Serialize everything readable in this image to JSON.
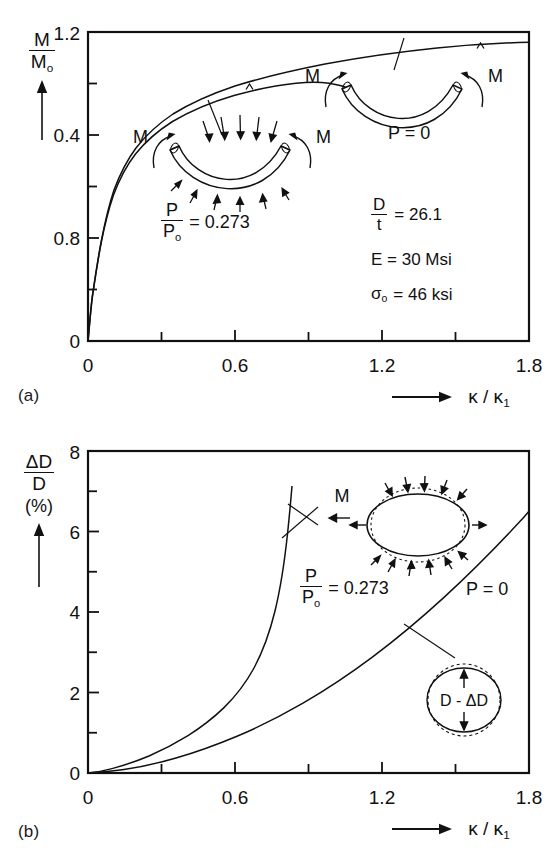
{
  "figure": {
    "kind": "two-panel line chart",
    "panel_tags": [
      "(a)",
      "(b)"
    ]
  },
  "panel_a": {
    "tag": "(a)",
    "ylabel": {
      "num": "M",
      "den": "M",
      "den_sub": "o",
      "arrow": "up-arrow"
    },
    "xlabel": {
      "text": "κ / κ",
      "sub": "1",
      "arrow": "right-arrow"
    },
    "yticks": [
      "0",
      "0.4",
      "0.8",
      "1.2"
    ],
    "xticks": [
      "0",
      "0.6",
      "1.2",
      "1.8"
    ],
    "annotations": {
      "pressurized": {
        "num": "P",
        "den": "P",
        "den_sub": "o",
        "value": "= 0.273"
      },
      "unpressurized": "P = 0",
      "moment_left": "M",
      "moment_right": "M"
    },
    "params": [
      {
        "type": "fraction",
        "num": "D",
        "den": "t",
        "value": "= 26.1"
      },
      {
        "type": "plain",
        "text": "E = 30 Msi"
      },
      {
        "type": "sigma",
        "symbol": "σ",
        "sub": "o",
        "value": "= 46 ksi"
      }
    ]
  },
  "panel_b": {
    "tag": "(b)",
    "ylabel": {
      "num": "ΔD",
      "den": "D",
      "units": "(%)",
      "arrow": "up-arrow"
    },
    "xlabel": {
      "text": "κ / κ",
      "sub": "1",
      "arrow": "right-arrow"
    },
    "yticks": [
      "0",
      "2",
      "4",
      "6",
      "8"
    ],
    "xticks": [
      "0",
      "0.6",
      "1.2",
      "1.8"
    ],
    "annotations": {
      "pressurized": {
        "num": "P",
        "den": "P",
        "den_sub": "o",
        "value": "= 0.273"
      },
      "unpressurized": "P = 0",
      "moment": "M",
      "diameter_change": "D - ΔD"
    }
  },
  "chart_data": [
    {
      "type": "line",
      "panel": "(a)",
      "title": "",
      "xlabel": "κ / κ₁",
      "ylabel": "M / Mₒ",
      "xlim": [
        0,
        1.8
      ],
      "ylim": [
        0,
        1.2
      ],
      "xticks": [
        0,
        0.6,
        1.2,
        1.8
      ],
      "yticks": [
        0,
        0.4,
        0.8,
        1.2
      ],
      "xtick_minor_step": 0.3,
      "ytick_minor_step": 0.2,
      "grid": false,
      "legend": "inline-annotation",
      "series": [
        {
          "name": "P = 0",
          "end_marker": "caret",
          "end_marker_x": 1.57,
          "x": [
            0,
            0.01,
            0.02,
            0.035,
            0.05,
            0.07,
            0.09,
            0.12,
            0.15,
            0.2,
            0.25,
            0.3,
            0.38,
            0.46,
            0.56,
            0.68,
            0.8,
            0.95,
            1.1,
            1.25,
            1.4,
            1.57,
            1.7,
            1.8
          ],
          "y": [
            0,
            0.09,
            0.19,
            0.32,
            0.43,
            0.55,
            0.64,
            0.74,
            0.8,
            0.88,
            0.93,
            0.97,
            1.01,
            1.05,
            1.08,
            1.11,
            1.13,
            1.15,
            1.16,
            1.17,
            1.18,
            1.185,
            1.19,
            1.19
          ]
        },
        {
          "name": "P / Pₒ = 0.273",
          "end_marker": "caret",
          "end_marker_x": 0.64,
          "x": [
            0,
            0.01,
            0.02,
            0.035,
            0.05,
            0.07,
            0.09,
            0.12,
            0.15,
            0.2,
            0.25,
            0.3,
            0.38,
            0.46,
            0.56,
            0.64,
            0.72,
            0.8,
            0.86
          ],
          "y": [
            0,
            0.085,
            0.18,
            0.3,
            0.41,
            0.53,
            0.62,
            0.715,
            0.775,
            0.855,
            0.905,
            0.945,
            0.985,
            1.015,
            1.04,
            1.05,
            1.045,
            1.03,
            1.01
          ]
        }
      ]
    },
    {
      "type": "line",
      "panel": "(b)",
      "title": "",
      "xlabel": "κ / κ₁",
      "ylabel": "ΔD / D (%)",
      "xlim": [
        0,
        1.8
      ],
      "ylim": [
        0,
        8
      ],
      "xticks": [
        0,
        0.6,
        1.2,
        1.8
      ],
      "yticks": [
        0,
        2,
        4,
        6,
        8
      ],
      "xtick_minor_step": 0.3,
      "ytick_minor_step": 1,
      "grid": false,
      "legend": "inline-annotation",
      "series": [
        {
          "name": "P / Pₒ = 0.273",
          "x": [
            0,
            0.05,
            0.1,
            0.15,
            0.2,
            0.3,
            0.4,
            0.5,
            0.6,
            0.66,
            0.72,
            0.78,
            0.82,
            0.86,
            0.89,
            0.91,
            0.925
          ],
          "y": [
            0,
            0.03,
            0.07,
            0.13,
            0.2,
            0.36,
            0.55,
            0.72,
            0.95,
            1.35,
            1.95,
            2.95,
            3.9,
            5.1,
            6.2,
            6.9,
            7.25
          ]
        },
        {
          "name": "P = 0",
          "x": [
            0,
            0.1,
            0.2,
            0.3,
            0.4,
            0.5,
            0.6,
            0.7,
            0.8,
            0.9,
            1.0,
            1.1,
            1.2,
            1.3,
            1.4,
            1.5,
            1.6,
            1.7,
            1.8
          ],
          "y": [
            0,
            0.03,
            0.07,
            0.14,
            0.24,
            0.37,
            0.52,
            0.72,
            0.95,
            1.22,
            1.55,
            1.92,
            2.33,
            2.8,
            3.3,
            3.9,
            4.6,
            5.35,
            6.1
          ]
        }
      ]
    }
  ]
}
